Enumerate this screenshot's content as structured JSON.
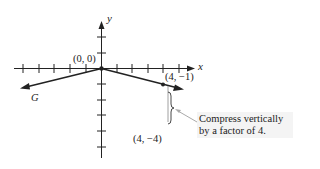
{
  "figure": {
    "axes": {
      "x_label": "x",
      "y_label": "y",
      "origin_label": "(0, 0)"
    },
    "graph_label": "G",
    "points": [
      {
        "label": "(4, −1)",
        "x": 4,
        "y": -1
      },
      {
        "label": "(4, −4)",
        "x": 4,
        "y": -4
      }
    ],
    "annotation": {
      "line1": "Compress vertically",
      "line2": "by a factor of 4."
    },
    "colors": {
      "ink": "#222222",
      "note_bg": "#f4f4f4",
      "pointer": "#aaaaaa"
    }
  }
}
